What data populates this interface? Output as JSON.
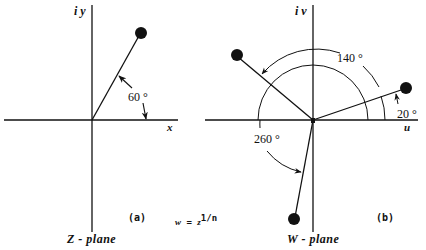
{
  "figure": {
    "formula": {
      "lhs": "w",
      "eq": "=",
      "base": "z",
      "exponent": "1/n"
    }
  },
  "panel_a": {
    "tag": "(a)",
    "plane_label": "Z - plane",
    "x_axis_label": "x",
    "y_axis_label": "i y",
    "angle_label": "60 °",
    "vectors": [
      {
        "angle_deg": 60
      }
    ]
  },
  "panel_b": {
    "tag": "(b)",
    "plane_label": "W - plane",
    "x_axis_label": "u",
    "y_axis_label": "i v",
    "angle_labels": [
      "140 °",
      "20 °",
      "260 °"
    ],
    "vectors": [
      {
        "angle_deg": 20
      },
      {
        "angle_deg": 140
      },
      {
        "angle_deg": 260
      }
    ]
  },
  "colors": {
    "ink": "#111111",
    "background": "#ffffff"
  }
}
